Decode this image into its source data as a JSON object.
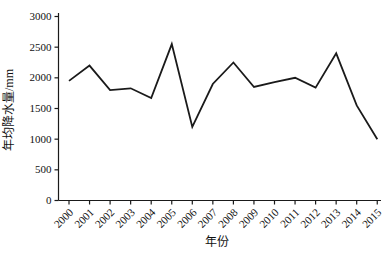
{
  "chart_data": {
    "type": "line",
    "title": "",
    "xlabel": "年份",
    "ylabel": "年均降水量/mm",
    "x": [
      2000,
      2001,
      2002,
      2003,
      2004,
      2005,
      2006,
      2007,
      2008,
      2009,
      2010,
      2011,
      2012,
      2013,
      2014,
      2015
    ],
    "values": [
      1950,
      2200,
      1800,
      1830,
      1670,
      2550,
      1200,
      1900,
      2250,
      1850,
      1930,
      2000,
      1840,
      2400,
      1550,
      1000
    ],
    "ylim": [
      0,
      3000
    ],
    "yticks": [
      0,
      500,
      1000,
      1500,
      2000,
      2500,
      3000
    ],
    "grid": "off",
    "legend": "none",
    "line_color": "#1a1a1a",
    "axis_color": "#1a1a1a",
    "background": "#ffffff"
  }
}
